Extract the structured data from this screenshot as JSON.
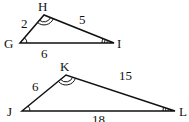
{
  "diagram": {
    "type": "similar-triangles",
    "stroke_color": "#111111",
    "triangles": [
      {
        "name": "triangle-GHI",
        "vertices": [
          {
            "label": "G",
            "x": 20,
            "y": 43,
            "label_x": 5,
            "label_y": 48,
            "angle_marks": 1
          },
          {
            "label": "H",
            "x": 44,
            "y": 15,
            "label_x": 38,
            "label_y": 11,
            "angle_marks": 2
          },
          {
            "label": "I",
            "x": 114,
            "y": 43,
            "label_x": 117,
            "label_y": 48,
            "angle_marks": 3
          }
        ],
        "sides": [
          {
            "between": "GH",
            "label": "2",
            "label_x": 22,
            "label_y": 28
          },
          {
            "between": "HI",
            "label": "5",
            "label_x": 79,
            "label_y": 24
          },
          {
            "between": "GI",
            "label": "6",
            "label_x": 41,
            "label_y": 58
          }
        ]
      },
      {
        "name": "triangle-JKL",
        "vertices": [
          {
            "label": "J",
            "x": 22,
            "y": 111,
            "label_x": 8,
            "label_y": 116,
            "angle_marks": 1
          },
          {
            "label": "K",
            "x": 66,
            "y": 75,
            "label_x": 61,
            "label_y": 70,
            "angle_marks": 2
          },
          {
            "label": "L",
            "x": 175,
            "y": 111,
            "label_x": 179,
            "label_y": 116,
            "angle_marks": 3
          }
        ],
        "sides": [
          {
            "between": "JK",
            "label": "6",
            "label_x": 33,
            "label_y": 91
          },
          {
            "between": "KL",
            "label": "15",
            "label_x": 120,
            "label_y": 79
          },
          {
            "between": "JL",
            "label": "18",
            "label_x": 93,
            "label_y": 124
          }
        ]
      }
    ]
  },
  "labels": {
    "G": "G",
    "H": "H",
    "I": "I",
    "J": "J",
    "K": "K",
    "L": "L",
    "GH": "2",
    "HI": "5",
    "GI": "6",
    "JK": "6",
    "KL": "15",
    "JL": "18"
  }
}
